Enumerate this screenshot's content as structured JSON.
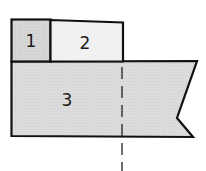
{
  "diagram": {
    "regions": [
      {
        "id": "1",
        "label": "1",
        "fill": "#d6d6d6"
      },
      {
        "id": "2",
        "label": "2",
        "fill": "#f1f1f1"
      },
      {
        "id": "3",
        "label": "3",
        "fill": "#dcdcdc"
      }
    ],
    "stroke_color": "#111111",
    "cut_line": {
      "style": "dashed"
    }
  }
}
